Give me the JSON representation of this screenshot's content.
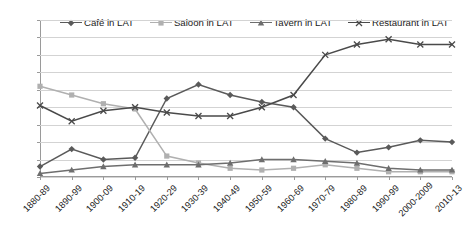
{
  "chart_data": {
    "type": "line",
    "title": "",
    "xlabel": "",
    "ylabel": "",
    "ylim": [
      0,
      90
    ],
    "ytick_step": 10,
    "grid": true,
    "legend_position": "top",
    "categories": [
      "1880-89",
      "1890-99",
      "1900-09",
      "1910-19",
      "1920-29",
      "1930-39",
      "1940-49",
      "1950-59",
      "1960-69",
      "1970-79",
      "1980-89",
      "1990-99",
      "2000-2009",
      "2010-13"
    ],
    "ytick_labels": [
      "90%",
      "80%",
      "70%",
      "60%",
      "50%",
      "40%",
      "30%",
      "20%",
      "10%",
      "0%"
    ],
    "series": [
      {
        "name": "Café in LAT",
        "marker": "diamond",
        "color": "#5a5a5a",
        "values": [
          6,
          16,
          10,
          11,
          45,
          53,
          47,
          43,
          40,
          22,
          14,
          17,
          21,
          20
        ]
      },
      {
        "name": "Saloon in LAT",
        "marker": "square",
        "color": "#b0b0b0",
        "values": [
          52,
          47,
          42,
          39,
          12,
          8,
          5,
          4,
          5,
          7,
          5,
          3,
          3,
          3
        ]
      },
      {
        "name": "Tavern in LAT",
        "marker": "triangle",
        "color": "#6e6e6e",
        "values": [
          2,
          4,
          6,
          7,
          7,
          7,
          8,
          10,
          10,
          9,
          8,
          5,
          4,
          4
        ]
      },
      {
        "name": "Restaurant in LAT",
        "marker": "x",
        "color": "#4a4a4a",
        "values": [
          41,
          32,
          38,
          40,
          37,
          35,
          35,
          40,
          47,
          70,
          76,
          79,
          76,
          76
        ]
      }
    ]
  }
}
